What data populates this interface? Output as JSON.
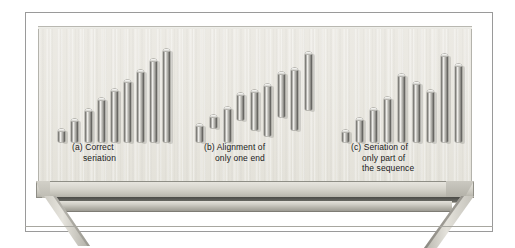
{
  "figure": {
    "background_color": "#ffffff",
    "board_color": "#eceae4",
    "rod_color": "#9b9a95",
    "frame_color": "#9a9a9a"
  },
  "chart_data": {
    "type": "bar",
    "title": "",
    "xlabel": "",
    "ylabel": "",
    "ylim": [
      0,
      100
    ],
    "grid": false,
    "legend": "none",
    "groups": [
      {
        "key": "a",
        "label": "(a) Correct\nseriation",
        "label_line1": "(a) Correct",
        "label_line2": "seriation",
        "alignment": "both-ends-ordered",
        "categories": [
          "1",
          "2",
          "3",
          "4",
          "5",
          "6",
          "7",
          "8",
          "9"
        ],
        "values": [
          13,
          23,
          33,
          44,
          53,
          62,
          72,
          83,
          93
        ],
        "baselines": [
          0,
          0,
          0,
          0,
          0,
          0,
          0,
          0,
          0
        ]
      },
      {
        "key": "b",
        "label": "(b) Alignment of\nonly one end",
        "label_line1": "(b) Alignment of",
        "label_line2": "only one end",
        "alignment": "top-ends-only",
        "categories": [
          "1",
          "2",
          "3",
          "4",
          "5",
          "6",
          "7",
          "8",
          "9"
        ],
        "values": [
          18,
          13,
          35,
          27,
          40,
          52,
          45,
          62,
          58
        ],
        "baselines": [
          0,
          14,
          0,
          22,
          12,
          6,
          25,
          12,
          32
        ]
      },
      {
        "key": "c",
        "label": "(c) Seriation of\nonly part of\nthe sequence",
        "label_line1": "(c) Seriation of",
        "label_line2": "only part of",
        "label_line3": "the sequence",
        "alignment": "partially-ordered",
        "categories": [
          "1",
          "2",
          "3",
          "4",
          "5",
          "6",
          "7",
          "8",
          "9"
        ],
        "values": [
          12,
          24,
          34,
          45,
          68,
          60,
          52,
          88,
          78
        ],
        "baselines": [
          0,
          0,
          0,
          0,
          0,
          0,
          0,
          0,
          0
        ]
      }
    ]
  }
}
